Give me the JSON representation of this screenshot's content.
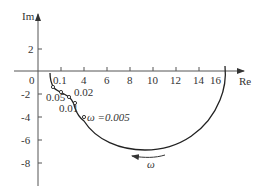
{
  "diagram": {
    "type": "nyquist-plot",
    "axes": {
      "x_label": "Re",
      "y_label": "Im",
      "origin_label": "0",
      "x_ticks": [
        "0.1",
        "4",
        "6",
        "8",
        "10",
        "12",
        "14",
        "16"
      ],
      "y_ticks": [
        "2",
        "-2",
        "-4",
        "-6",
        "-8"
      ]
    },
    "frequency_markers": [
      {
        "label": "0.1"
      },
      {
        "label": "0.05"
      },
      {
        "label": "0.02"
      },
      {
        "label": "0.01"
      },
      {
        "label": "ω =0.005"
      }
    ],
    "direction_label": "ω",
    "colors": {
      "line": "#222222",
      "axis": "#555555"
    }
  }
}
